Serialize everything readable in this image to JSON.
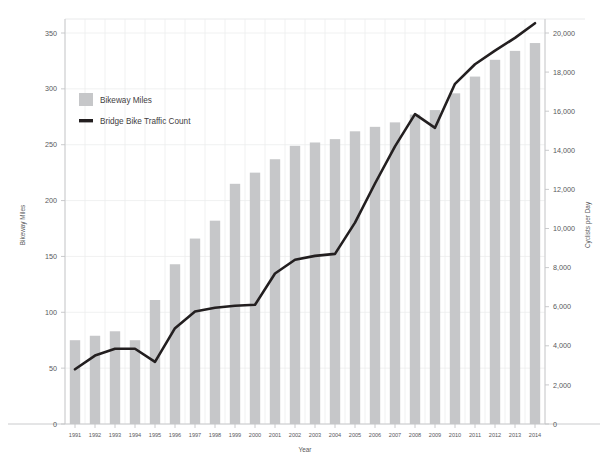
{
  "chart_data": {
    "type": "bar",
    "title": "",
    "subtitle": "",
    "xlabel": "Year",
    "ylabel": "Bikeway Miles",
    "y2label": "Cyclists per Day",
    "grid": true,
    "legend_position": "inside-top-left",
    "categories": [
      "1991",
      "1992",
      "1993",
      "1994",
      "1995",
      "1996",
      "1997",
      "1998",
      "1999",
      "2000",
      "2001",
      "2002",
      "2003",
      "2004",
      "2005",
      "2006",
      "2007",
      "2008",
      "2009",
      "2010",
      "2011",
      "2012",
      "2013",
      "2014"
    ],
    "ylim": [
      0,
      350
    ],
    "yticks": [
      "0",
      "50",
      "100",
      "150",
      "200",
      "250",
      "300",
      "350"
    ],
    "ytick_values": [
      0,
      50,
      100,
      150,
      200,
      250,
      300,
      350
    ],
    "y2lim": [
      0,
      20000
    ],
    "y2ticks": [
      "0",
      "2,000",
      "4,000",
      "6,000",
      "8,000",
      "10,000",
      "12,000",
      "14,000",
      "16,000",
      "18,000",
      "20,000"
    ],
    "y2tick_values": [
      0,
      2000,
      4000,
      6000,
      8000,
      10000,
      12000,
      14000,
      16000,
      18000,
      20000
    ],
    "series": [
      {
        "name": "Bikeway Miles",
        "type": "bar",
        "axis": "left",
        "color": "#c6c7c9",
        "values": [
          75,
          79,
          83,
          75,
          111,
          143,
          166,
          182,
          215,
          225,
          237,
          249,
          252,
          255,
          262,
          266,
          270,
          277,
          281,
          296,
          311,
          326,
          334,
          341
        ]
      },
      {
        "name": "Bridge Bike Traffic Count",
        "type": "line",
        "axis": "right",
        "color": "#231f20",
        "values": [
          2800,
          3500,
          3850,
          3850,
          3180,
          4900,
          5750,
          5950,
          6050,
          6100,
          7700,
          8400,
          8600,
          8700,
          10300,
          12300,
          14200,
          15850,
          15150,
          17400,
          18400,
          19100,
          19750,
          20500
        ]
      }
    ]
  },
  "legend": {
    "items": [
      {
        "label": "Bikeway Miles",
        "marker": "square",
        "color": "#c6c7c9"
      },
      {
        "label": "Bridge Bike Traffic Count",
        "marker": "line",
        "color": "#231f20"
      }
    ]
  }
}
